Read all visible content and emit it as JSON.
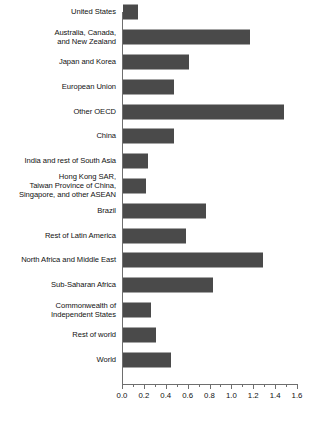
{
  "chart_data": {
    "type": "bar",
    "orientation": "horizontal",
    "title": "",
    "subtitle": "",
    "xlabel": "",
    "ylabel": "",
    "xlim": [
      0.0,
      1.6
    ],
    "grid": false,
    "legend": false,
    "bar_color": "#4a4a4a",
    "axis_color": "#6e6e6e",
    "text_color": "#111111",
    "background": "#ffffff",
    "xticks": [
      {
        "value": 0.0,
        "label": "0.0"
      },
      {
        "value": 0.2,
        "label": "0.2"
      },
      {
        "value": 0.4,
        "label": "0.4"
      },
      {
        "value": 0.6,
        "label": "0.6"
      },
      {
        "value": 0.8,
        "label": "0.8"
      },
      {
        "value": 1.0,
        "label": "1.0"
      },
      {
        "value": 1.2,
        "label": "1.2"
      },
      {
        "value": 1.4,
        "label": "1.4"
      },
      {
        "value": 1.6,
        "label": "1.6"
      }
    ],
    "minor_tick_step": 0.1,
    "categories": [
      "United States",
      "Australia, Canada,\nand New Zealand",
      "Japan and Korea",
      "European Union",
      "Other OECD",
      "China",
      "India and rest of South Asia",
      "Hong Kong SAR,\nTaiwan Province of China,\nSingapore, and other ASEAN",
      "Brazil",
      "Rest of Latin America",
      "North Africa and Middle East",
      "Sub-Saharan Africa",
      "Commonwealth of\nIndependent States",
      "Rest of world",
      "World"
    ],
    "values": [
      0.14,
      1.16,
      0.6,
      0.47,
      1.47,
      0.47,
      0.23,
      0.21,
      0.76,
      0.58,
      1.28,
      0.82,
      0.26,
      0.3,
      0.44
    ]
  }
}
